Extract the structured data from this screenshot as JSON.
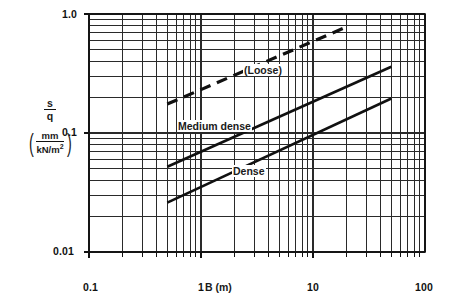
{
  "chart_data": {
    "type": "line",
    "title": "",
    "xlabel": "B (m)",
    "ylabel": "s/q",
    "ylabel_parts": {
      "numerator": "s",
      "denominator": "q"
    },
    "yunits": {
      "numerator": "mm",
      "denominator": "kN/m²",
      "display": "(mm / kN/m²)"
    },
    "xscale": "log",
    "yscale": "log",
    "xlim": [
      0.1,
      100
    ],
    "ylim": [
      0.01,
      1.0
    ],
    "grid": "log-log minor grid on",
    "legend": "inline curve labels",
    "xticks": [
      "0.1",
      "1",
      "10",
      "100"
    ],
    "xtick_values": [
      0.1,
      1,
      10,
      100
    ],
    "yticks": [
      "1.0",
      "0.1",
      "0.01"
    ],
    "ytick_values": [
      1.0,
      0.1,
      0.01
    ],
    "series": [
      {
        "name": "(Loose)",
        "style": "dashed",
        "x": [
          0.5,
          20
        ],
        "y": [
          0.175,
          0.78
        ]
      },
      {
        "name": "Medium dense",
        "style": "solid",
        "x": [
          0.5,
          50
        ],
        "y": [
          0.052,
          0.36
        ]
      },
      {
        "name": "Dense",
        "style": "solid",
        "x": [
          0.5,
          50
        ],
        "y": [
          0.026,
          0.195
        ]
      }
    ]
  },
  "labels": {
    "y_top": "1.0",
    "y_mid": "0.1",
    "y_bottom": "0.01",
    "x_0_1": "0.1",
    "x_1": "1",
    "x_10": "10",
    "x_100": "100",
    "x_axis_title": "B (m)",
    "y_num": "s",
    "y_den": "q",
    "unit_num": "mm",
    "unit_den_text": "kN/m",
    "unit_den_sup": "2",
    "curve_loose": "(Loose)",
    "curve_medium": "Medium dense",
    "curve_dense": "Dense"
  },
  "colors": {
    "background": "#ffffff",
    "line": "#111111",
    "grid": "#2a2a2a",
    "axis": "#111111"
  }
}
